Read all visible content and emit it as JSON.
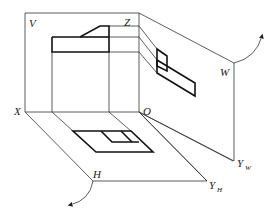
{
  "figure": {
    "type": "three-view projection system (orthographic projection planes unfolding)",
    "labels": {
      "V": "V",
      "Z": "Z",
      "W": "W",
      "O": "O",
      "X": "X",
      "H": "H",
      "Y_W": "Y",
      "Y_W_sub": "W",
      "Y_H": "Y",
      "Y_H_sub": "H"
    },
    "planes": [
      {
        "name": "V",
        "description": "frontal projection plane"
      },
      {
        "name": "H",
        "description": "horizontal projection plane"
      },
      {
        "name": "W",
        "description": "profile projection plane"
      }
    ],
    "rotation_arrows": [
      {
        "plane": "W",
        "direction": "rotate upward/backward"
      },
      {
        "plane": "H",
        "direction": "rotate downward"
      }
    ],
    "colors": {
      "line": "#333333",
      "outline": "#111111",
      "background": "#ffffff"
    }
  }
}
